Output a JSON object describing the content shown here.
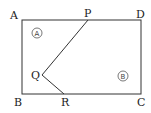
{
  "diagram": {
    "type": "geometry-figure",
    "shape": "rectangle ABCD with polyline P-Q-R dividing it into two regions",
    "colors": {
      "stroke": "#333333",
      "text": "#222222",
      "background": "#ffffff"
    },
    "points": {
      "A": {
        "label": "A",
        "x": 22,
        "y": 20
      },
      "B": {
        "label": "B",
        "x": 22,
        "y": 94
      },
      "C": {
        "label": "C",
        "x": 141,
        "y": 94
      },
      "D": {
        "label": "D",
        "x": 141,
        "y": 20
      },
      "P": {
        "label": "P",
        "x": 88,
        "y": 20
      },
      "Q": {
        "label": "Q",
        "x": 42,
        "y": 75
      },
      "R": {
        "label": "R",
        "x": 64,
        "y": 94
      }
    },
    "regions": [
      {
        "label": "A",
        "symbol": "Ⓐ",
        "x": 37,
        "y": 30
      },
      {
        "label": "B",
        "symbol": "Ⓑ",
        "x": 123,
        "y": 76
      }
    ]
  }
}
